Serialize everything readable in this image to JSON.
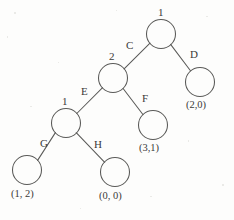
{
  "diagram": {
    "type": "binary-tree",
    "background_color": "#fdfdfc",
    "stroke_color": "#5a5a58",
    "text_color": "#3a3a38",
    "nodes": [
      {
        "id": "root",
        "value": "1",
        "cx": 161,
        "cy": 34,
        "r": 14.5
      },
      {
        "id": "nodeD",
        "value": "(2,0)",
        "cx": 200,
        "cy": 82,
        "r": 14.5
      },
      {
        "id": "node2",
        "value": "2",
        "cx": 113,
        "cy": 78,
        "r": 14.5
      },
      {
        "id": "nodeF",
        "value": "(3,1)",
        "cx": 153,
        "cy": 125,
        "r": 14.5
      },
      {
        "id": "node1b",
        "value": "1",
        "cx": 66,
        "cy": 123,
        "r": 14.5
      },
      {
        "id": "nodeG",
        "value": "(1, 2)",
        "cx": 27,
        "cy": 170,
        "r": 14.5
      },
      {
        "id": "nodeH",
        "value": "(0, 0)",
        "cx": 115,
        "cy": 172,
        "r": 14.5
      }
    ],
    "node_values": {
      "root": "1",
      "node2": "2",
      "node1b": "1"
    },
    "leaf_values": {
      "nodeD": "(2,0)",
      "nodeF": "(3,1)",
      "nodeG": "(1, 2)",
      "nodeH": "(0, 0)"
    },
    "edges": [
      {
        "id": "edge-C",
        "label": "C",
        "from": "root",
        "to": "node2",
        "label_x": 126,
        "label_y": 40
      },
      {
        "id": "edge-D",
        "label": "D",
        "from": "root",
        "to": "nodeD",
        "label_x": 190,
        "label_y": 49
      },
      {
        "id": "edge-E",
        "label": "E",
        "from": "node2",
        "to": "node1b",
        "label_x": 81,
        "label_y": 86
      },
      {
        "id": "edge-F",
        "label": "F",
        "from": "node2",
        "to": "nodeF",
        "label_x": 142,
        "label_y": 93
      },
      {
        "id": "edge-G",
        "label": "G",
        "from": "node1b",
        "to": "nodeG",
        "label_x": 40,
        "label_y": 138
      },
      {
        "id": "edge-H",
        "label": "H",
        "from": "node1b",
        "to": "nodeH",
        "label_x": 94,
        "label_y": 139
      }
    ],
    "edge_labels": {
      "C": "C",
      "D": "D",
      "E": "E",
      "F": "F",
      "G": "G",
      "H": "H"
    }
  }
}
